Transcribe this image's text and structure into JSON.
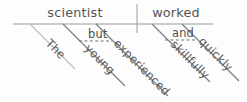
{
  "diagram": {
    "type": "sentence-diagram",
    "sentence": "The young but experienced scientist worked skillfully and quickly.",
    "subject": {
      "label": "scientist",
      "x": 75,
      "y": 17
    },
    "predicate": {
      "label": "worked",
      "x": 176,
      "y": 17
    },
    "divider": {
      "name": "subject-predicate-divider",
      "x": 137,
      "y_top": 4,
      "y_bottom": 33
    },
    "baseline": {
      "name": "main-baseline",
      "x_start": 13,
      "x_end": 213,
      "y": 24
    },
    "modifiers": [
      {
        "id": "the",
        "label": "The",
        "attaches_to": "scientist",
        "faint": true,
        "x1": 30,
        "y1": 24,
        "x2": 75,
        "y2": 69,
        "label_x": 45,
        "label_y": 44
      },
      {
        "id": "young",
        "label": "young",
        "attaches_to": "scientist",
        "faint": false,
        "x1": 63,
        "y1": 24,
        "x2": 125,
        "y2": 86,
        "label_x": 84,
        "label_y": 49
      },
      {
        "id": "experienced",
        "label": "experienced",
        "attaches_to": "scientist",
        "faint": false,
        "x1": 96,
        "y1": 24,
        "x2": 168,
        "y2": 96,
        "label_x": 113,
        "label_y": 44
      },
      {
        "id": "skillfully",
        "label": "skillfully",
        "attaches_to": "worked",
        "faint": false,
        "x1": 152,
        "y1": 24,
        "x2": 210,
        "y2": 82,
        "label_x": 170,
        "label_y": 45
      },
      {
        "id": "quickly",
        "label": "quickly",
        "attaches_to": "worked",
        "faint": false,
        "x1": 182,
        "y1": 24,
        "x2": 239,
        "y2": 81,
        "label_x": 198,
        "label_y": 42
      }
    ],
    "conjunctions": [
      {
        "id": "but",
        "label": "but",
        "joins": [
          "young",
          "experienced"
        ],
        "dash_x1": 79,
        "dash_y1": 41,
        "dash_x2": 112,
        "dash_y2": 41,
        "label_x": 88,
        "label_y": 38
      },
      {
        "id": "and",
        "label": "and",
        "joins": [
          "skillfully",
          "quickly"
        ],
        "dash_x1": 165,
        "dash_y1": 40,
        "dash_x2": 196,
        "dash_y2": 40,
        "label_x": 172,
        "label_y": 37
      }
    ],
    "colors": {
      "background": "#fdfdfd",
      "line": "#8e8e8e",
      "line_faint": "#c2c2c2",
      "text": "#555555",
      "dashed": "#6f6f6f"
    }
  }
}
